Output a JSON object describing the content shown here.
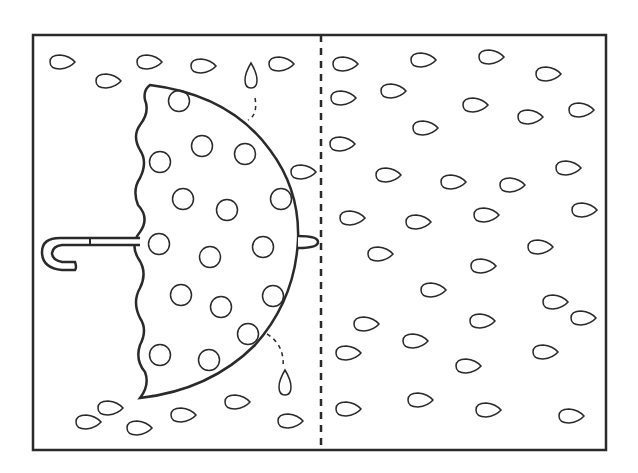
{
  "illustration": {
    "subject": "umbrella-half-picture-symmetry-worksheet",
    "stroke_color": "#2a2a2a",
    "background": "#ffffff",
    "frame": {
      "x": 33,
      "y": 35,
      "w": 262,
      "h": 184,
      "right": 606,
      "bottom": 450
    },
    "center_line_x": 321,
    "umbrella_dots": [
      [
        179,
        101
      ],
      [
        202,
        146
      ],
      [
        245,
        154
      ],
      [
        160,
        162
      ],
      [
        183,
        199
      ],
      [
        227,
        210
      ],
      [
        281,
        199
      ],
      [
        159,
        244
      ],
      [
        210,
        257
      ],
      [
        263,
        247
      ],
      [
        181,
        295
      ],
      [
        221,
        307
      ],
      [
        273,
        296
      ],
      [
        248,
        334
      ],
      [
        160,
        355
      ],
      [
        209,
        360
      ]
    ],
    "drops_left": [
      [
        62,
        62
      ],
      [
        108,
        81
      ],
      [
        149,
        62
      ],
      [
        203,
        66
      ],
      [
        281,
        64
      ],
      [
        88,
        422
      ],
      [
        110,
        408
      ],
      [
        139,
        428
      ],
      [
        183,
        415
      ],
      [
        237,
        402
      ],
      [
        290,
        421
      ],
      [
        303,
        172
      ]
    ],
    "drops_right": [
      [
        345,
        64
      ],
      [
        423,
        60
      ],
      [
        491,
        57
      ],
      [
        548,
        74
      ],
      [
        343,
        98
      ],
      [
        393,
        91
      ],
      [
        475,
        105
      ],
      [
        530,
        117
      ],
      [
        581,
        110
      ],
      [
        425,
        128
      ],
      [
        342,
        144
      ],
      [
        388,
        175
      ],
      [
        453,
        182
      ],
      [
        512,
        185
      ],
      [
        568,
        168
      ],
      [
        584,
        210
      ],
      [
        352,
        218
      ],
      [
        418,
        222
      ],
      [
        486,
        215
      ],
      [
        540,
        247
      ],
      [
        380,
        254
      ],
      [
        483,
        266
      ],
      [
        433,
        290
      ],
      [
        555,
        302
      ],
      [
        583,
        318
      ],
      [
        366,
        324
      ],
      [
        415,
        341
      ],
      [
        482,
        321
      ],
      [
        545,
        352
      ],
      [
        468,
        366
      ],
      [
        348,
        353
      ],
      [
        420,
        400
      ],
      [
        488,
        410
      ],
      [
        348,
        409
      ],
      [
        571,
        416
      ]
    ],
    "vertical_drops": [
      [
        251,
        75
      ],
      [
        285,
        382
      ]
    ]
  }
}
